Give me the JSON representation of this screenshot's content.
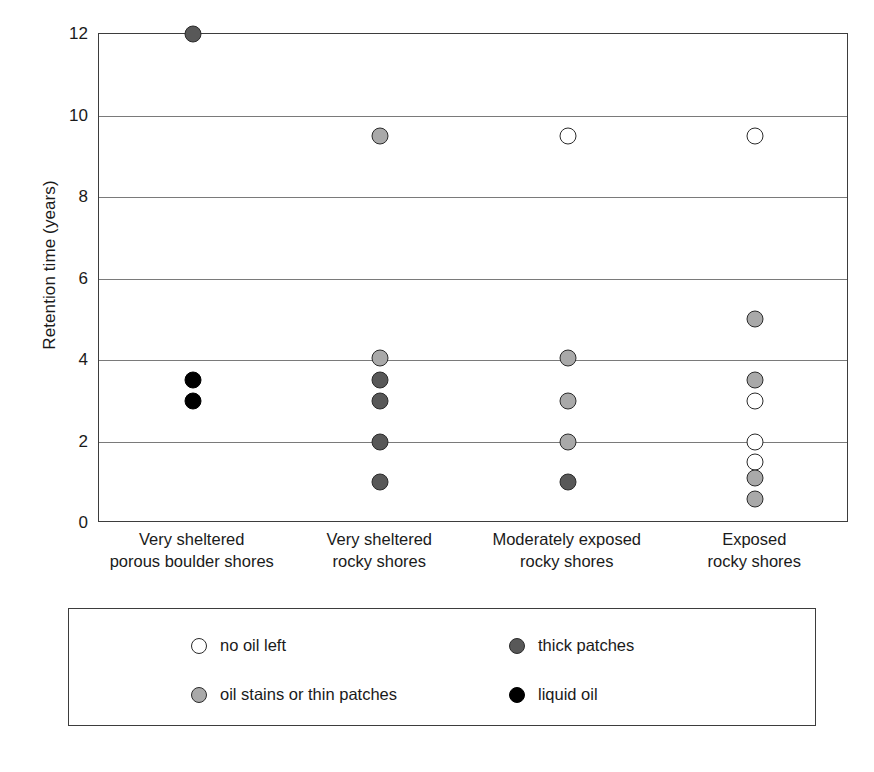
{
  "chart_data": {
    "type": "scatter",
    "title": "",
    "xlabel": "",
    "ylabel": "Retention time (years)",
    "ylim": [
      0,
      12
    ],
    "yticks": [
      0,
      2,
      4,
      6,
      8,
      10,
      12
    ],
    "ytick_labels": [
      "0",
      "2",
      "4",
      "6",
      "8",
      "10",
      "12"
    ],
    "grid": true,
    "grid_axis": "y",
    "legend_position": "below-plot",
    "categories": [
      "Very sheltered\nporous boulder shores",
      "Very sheltered\nrocky shores",
      "Moderately exposed\nrocky shores",
      "Exposed\nrocky shores"
    ],
    "category_labels": [
      {
        "line1": "Very sheltered",
        "line2": "porous boulder shores"
      },
      {
        "line1": "Very sheltered",
        "line2": "rocky shores"
      },
      {
        "line1": "Moderately exposed",
        "line2": "rocky shores"
      },
      {
        "line1": "Exposed",
        "line2": "rocky shores"
      }
    ],
    "series": [
      {
        "name": "no oil left",
        "marker": "white",
        "color": "#ffffff",
        "points": [
          {
            "category": 2,
            "value": 9.5
          },
          {
            "category": 3,
            "value": 9.5
          },
          {
            "category": 3,
            "value": 3.0
          },
          {
            "category": 3,
            "value": 2.0
          },
          {
            "category": 3,
            "value": 1.5
          }
        ]
      },
      {
        "name": "oil stains or thin patches",
        "marker": "lightgray",
        "color": "#a9a9a9",
        "points": [
          {
            "category": 1,
            "value": 9.5
          },
          {
            "category": 1,
            "value": 4.05
          },
          {
            "category": 2,
            "value": 4.05
          },
          {
            "category": 2,
            "value": 3.0
          },
          {
            "category": 2,
            "value": 2.0
          },
          {
            "category": 3,
            "value": 5.0
          },
          {
            "category": 3,
            "value": 3.5
          },
          {
            "category": 3,
            "value": 1.1
          },
          {
            "category": 3,
            "value": 0.6
          }
        ]
      },
      {
        "name": "thick patches",
        "marker": "darkgray",
        "color": "#585858",
        "points": [
          {
            "category": 0,
            "value": 12.0
          },
          {
            "category": 1,
            "value": 3.5
          },
          {
            "category": 1,
            "value": 3.0
          },
          {
            "category": 1,
            "value": 2.0
          },
          {
            "category": 1,
            "value": 1.0
          },
          {
            "category": 2,
            "value": 1.0
          }
        ]
      },
      {
        "name": "liquid oil",
        "marker": "black",
        "color": "#000000",
        "points": [
          {
            "category": 0,
            "value": 3.5
          },
          {
            "category": 0,
            "value": 3.0
          }
        ]
      }
    ],
    "legend": [
      {
        "label": "no oil left",
        "marker": "white",
        "color": "#ffffff"
      },
      {
        "label": "thick patches",
        "marker": "darkgray",
        "color": "#585858"
      },
      {
        "label": "oil stains or thin patches",
        "marker": "lightgray",
        "color": "#a9a9a9"
      },
      {
        "label": "liquid oil",
        "marker": "black",
        "color": "#000000"
      }
    ]
  }
}
